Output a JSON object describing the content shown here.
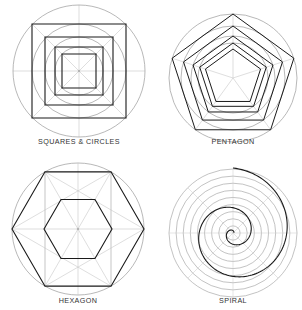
{
  "figures": [
    {
      "id": "squares-circles",
      "label": "SQUARES & CIRCLES",
      "center": [
        79,
        71
      ],
      "outer_radius": 66,
      "square_half_sizes": [
        47,
        34,
        24,
        17
      ],
      "circle_radii": [
        66,
        47,
        34,
        24
      ]
    },
    {
      "id": "pentagon",
      "label": "PENTAGON",
      "center": [
        233,
        78
      ],
      "outer_radius": 64,
      "pentagon_radii": [
        64,
        52,
        42,
        35,
        29
      ],
      "circle_radii": [
        64,
        52,
        42,
        35
      ]
    },
    {
      "id": "hexagon",
      "label": "HEXAGON",
      "center": [
        78,
        229
      ],
      "outer_radius": 66,
      "hexagon_radii": [
        66,
        34
      ]
    },
    {
      "id": "spiral",
      "label": "SPIRAL",
      "center": [
        233,
        233
      ],
      "outer_radius": 64,
      "ring_count": 9
    }
  ],
  "colors": {
    "guide": "#9a9a9a",
    "guide_light": "#c8c8c8",
    "stroke": "#1a1a1a",
    "label": "#333333"
  }
}
